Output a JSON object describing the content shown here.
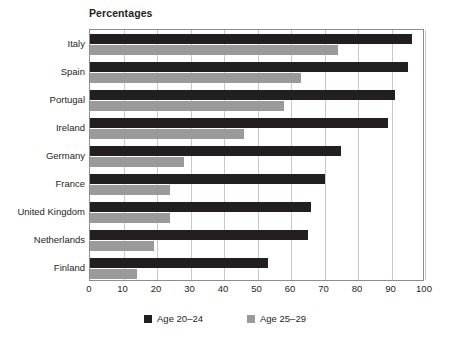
{
  "chart": {
    "title": "Percentages",
    "axis": {
      "xlabel": "",
      "ylabel": "",
      "xticks": [
        "0",
        "10",
        "20",
        "30",
        "40",
        "50",
        "60",
        "70",
        "80",
        "90",
        "100"
      ]
    },
    "legend": [
      {
        "label": "Age 20–24",
        "color": "#231f20",
        "swatch": "legend-swatch-black"
      },
      {
        "label": "Age 25–29",
        "color": "#9a9a9a",
        "swatch": "legend-swatch-gray"
      }
    ]
  },
  "chart_data": {
    "type": "bar",
    "orientation": "horizontal",
    "title": "Percentages",
    "xlabel": "",
    "ylabel": "",
    "xlim": [
      0,
      100
    ],
    "xticks": [
      0,
      10,
      20,
      30,
      40,
      50,
      60,
      70,
      80,
      90,
      100
    ],
    "grid": true,
    "legend_position": "bottom",
    "categories": [
      "Italy",
      "Spain",
      "Portugal",
      "Ireland",
      "Germany",
      "France",
      "United Kingdom",
      "Netherlands",
      "Finland"
    ],
    "series": [
      {
        "name": "Age 20–24",
        "color": "#231f20",
        "values": [
          96,
          95,
          91,
          89,
          75,
          70,
          66,
          65,
          53
        ]
      },
      {
        "name": "Age 25–29",
        "color": "#9a9a9a",
        "values": [
          74,
          63,
          58,
          46,
          28,
          24,
          24,
          19,
          14
        ]
      }
    ]
  }
}
